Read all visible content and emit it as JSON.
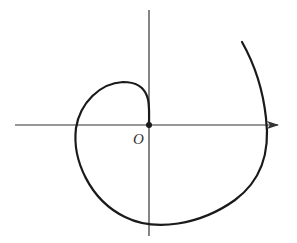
{
  "diagram": {
    "type": "polar-spiral",
    "origin_label": "O",
    "colors": {
      "stroke": "#1a1a1a",
      "axis": "#333333",
      "background": "#ffffff"
    },
    "axes": {
      "x_axis": {
        "from": [
          15,
          125
        ],
        "to": [
          278,
          125
        ],
        "arrow": "right"
      },
      "y_axis": {
        "from": [
          149,
          10
        ],
        "to": [
          149,
          236
        ],
        "arrow": "none"
      }
    },
    "origin": [
      149,
      125
    ]
  }
}
